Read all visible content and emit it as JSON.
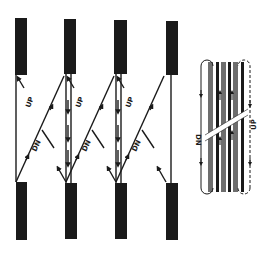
{
  "diagram": {
    "labels": {
      "up": "UP",
      "dn": "DN"
    },
    "inset": {
      "left_label": "DN",
      "right_label": "UP"
    },
    "colors": {
      "ink": "#1a1a1a",
      "grey": "#6e6e6e",
      "background": "#ffffff"
    }
  }
}
